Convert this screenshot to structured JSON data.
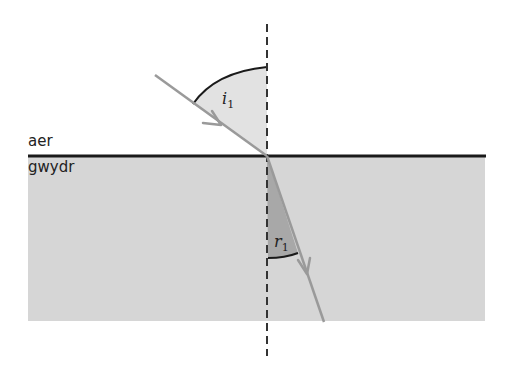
{
  "diagram": {
    "type": "refraction",
    "media": {
      "top": "aer",
      "bottom": "gwydr"
    },
    "angles": {
      "incidence_symbol": "i",
      "incidence_subscript": "1",
      "refraction_symbol": "r",
      "refraction_subscript": "1"
    },
    "colors": {
      "glass": "#d6d6d6",
      "interface": "#1a1a1a",
      "normal": "#333333",
      "ray": "#9a9a9a",
      "incidence_fill": "#e2e2e2",
      "refraction_fill": "#a8a8a8",
      "arc": "#1a1a1a"
    }
  }
}
